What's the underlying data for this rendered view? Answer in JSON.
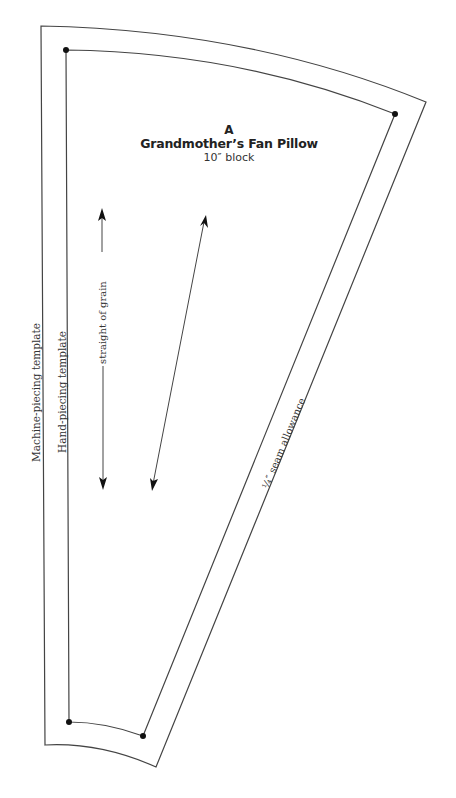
{
  "pattern": {
    "letter": "A",
    "title": "Grandmother’s Fan Pillow",
    "subtitle": "10″ block"
  },
  "labels": {
    "machine_piecing": "Machine-piecing template",
    "hand_piecing": "Hand-piecing template",
    "grain": "straight of grain",
    "seam_allowance": "¼″ seam allowance"
  },
  "colors": {
    "line": "#333333",
    "dot": "#111111",
    "background": "#ffffff"
  }
}
